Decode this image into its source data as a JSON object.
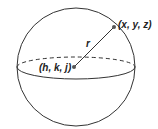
{
  "diagram": {
    "labels": {
      "center": "(h, k, j)",
      "point": "(x, y, z)",
      "radius": "r"
    },
    "colors": {
      "stroke": "#333333",
      "point": "#555555"
    }
  }
}
